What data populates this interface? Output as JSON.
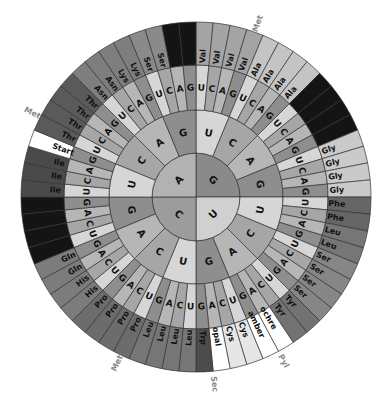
{
  "diagram": {
    "center": [
      196,
      197
    ],
    "radii": {
      "inner": 44,
      "second": 87,
      "third": 132,
      "outer": 175
    },
    "base_order_clockwise_from_top": [
      "G",
      "U",
      "C",
      "A"
    ],
    "sub_order_clockwise": [
      "U",
      "C",
      "A",
      "G"
    ],
    "base_colors": {
      "U": "#d6d6d6",
      "C": "#a6a6a6",
      "A": "#b6b6b6",
      "G": "#8e8e8e"
    },
    "inner_colors": {
      "G": "#8a8a8a",
      "U": "#d0d0d0",
      "C": "#9c9c9c",
      "A": "#b2b2b2"
    },
    "codons": {
      "G": {
        "U": [
          [
            "Val",
            "#a4a4a4"
          ],
          [
            "Val",
            "#a4a4a4"
          ],
          [
            "Val",
            "#a4a4a4"
          ],
          [
            "Val",
            "#a4a4a4"
          ]
        ],
        "C": [
          [
            "Ala",
            "#c4c4c4"
          ],
          [
            "Ala",
            "#c4c4c4"
          ],
          [
            "Ala",
            "#c4c4c4"
          ],
          [
            "Ala",
            "#c4c4c4"
          ]
        ],
        "A": [
          [
            "",
            "#141414"
          ],
          [
            "",
            "#141414"
          ],
          [
            "",
            "#141414"
          ],
          [
            "",
            "#141414"
          ]
        ],
        "G": [
          [
            "Gly",
            "#cacaca"
          ],
          [
            "Gly",
            "#cacaca"
          ],
          [
            "Gly",
            "#cacaca"
          ],
          [
            "Gly",
            "#cacaca"
          ]
        ]
      },
      "U": {
        "U": [
          [
            "Phe",
            "#666666"
          ],
          [
            "Phe",
            "#666666"
          ],
          [
            "Leu",
            "#767676"
          ],
          [
            "Leu",
            "#767676"
          ]
        ],
        "C": [
          [
            "Ser",
            "#868686"
          ],
          [
            "Ser",
            "#868686"
          ],
          [
            "Ser",
            "#868686"
          ],
          [
            "Ser",
            "#868686"
          ]
        ],
        "A": [
          [
            "Tyr",
            "#727272"
          ],
          [
            "Tyr",
            "#727272"
          ],
          [
            "ochre",
            "#ffffff"
          ],
          [
            "amber",
            "#ffffff"
          ]
        ],
        "G": [
          [
            "Cys",
            "#e6e6e6"
          ],
          [
            "Cys",
            "#e6e6e6"
          ],
          [
            "opal",
            "#ffffff"
          ],
          [
            "Trp",
            "#4c4c4c"
          ]
        ]
      },
      "C": {
        "U": [
          [
            "Leu",
            "#767676"
          ],
          [
            "Leu",
            "#767676"
          ],
          [
            "Leu",
            "#767676"
          ],
          [
            "Leu",
            "#767676"
          ]
        ],
        "C": [
          [
            "Pro",
            "#6c6c6c"
          ],
          [
            "Pro",
            "#6c6c6c"
          ],
          [
            "Pro",
            "#6c6c6c"
          ],
          [
            "Pro",
            "#6c6c6c"
          ]
        ],
        "A": [
          [
            "His",
            "#7c7c7c"
          ],
          [
            "His",
            "#7c7c7c"
          ],
          [
            "Gln",
            "#7c7c7c"
          ],
          [
            "Gln",
            "#7c7c7c"
          ]
        ],
        "G": [
          [
            "",
            "#141414"
          ],
          [
            "",
            "#141414"
          ],
          [
            "",
            "#141414"
          ],
          [
            "",
            "#141414"
          ]
        ]
      },
      "A": {
        "U": [
          [
            "Ile",
            "#4a4a4a"
          ],
          [
            "Ile",
            "#4a4a4a"
          ],
          [
            "Ile",
            "#4a4a4a"
          ],
          [
            "Start",
            "#ffffff"
          ]
        ],
        "C": [
          [
            "Thr",
            "#5a5a5a"
          ],
          [
            "Thr",
            "#5a5a5a"
          ],
          [
            "Thr",
            "#5a5a5a"
          ],
          [
            "Thr",
            "#5a5a5a"
          ]
        ],
        "A": [
          [
            "Asn",
            "#7e7e7e"
          ],
          [
            "Asn",
            "#7e7e7e"
          ],
          [
            "Lys",
            "#7e7e7e"
          ],
          [
            "Lys",
            "#7e7e7e"
          ]
        ],
        "G": [
          [
            "Ser",
            "#8a8a8a"
          ],
          [
            "Ser",
            "#8a8a8a"
          ],
          [
            "",
            "#141414"
          ],
          [
            "",
            "#141414"
          ]
        ]
      }
    },
    "external_labels": [
      {
        "text": "Met",
        "angle": 297.2,
        "r": 184,
        "name": "met-label-start"
      },
      {
        "text": "Met",
        "angle": 19.6,
        "r": 184,
        "name": "met-label-top"
      },
      {
        "text": "Met",
        "angle": 205.4,
        "r": 184,
        "name": "met-label-bottom"
      },
      {
        "text": "Sec",
        "angle": 174.4,
        "r": 188,
        "name": "sec-label"
      },
      {
        "text": "Pyl",
        "angle": 151.9,
        "r": 186,
        "name": "pyl-label"
      }
    ]
  }
}
